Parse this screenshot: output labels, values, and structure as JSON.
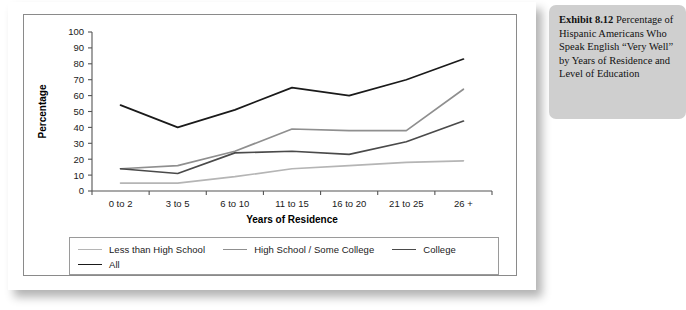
{
  "caption": {
    "lead": "Exhibit 8.12",
    "body": " Percentage of Hispanic Americans Who Speak English “Very Well” by Years of Residence and Level of Education"
  },
  "colors": {
    "series_less_than_high_school": "#b5b5b5",
    "series_high_school_some_college": "#8f8f8f",
    "series_college": "#4a4a4a",
    "series_all": "#1a1a1a",
    "axis": "#555555",
    "frame": "#8a8a8a",
    "caption_bg": "#cfcfcf",
    "card_bg": "#ffffff"
  },
  "chart_data": {
    "type": "line",
    "title": "",
    "xlabel": "Years of Residence",
    "ylabel": "Percentage",
    "categories": [
      "0 to 2",
      "3 to 5",
      "6 to 10",
      "11 to 15",
      "16 to 20",
      "21 to 25",
      "26 +"
    ],
    "ylim": [
      0,
      100
    ],
    "yticks": [
      0,
      10,
      20,
      30,
      40,
      50,
      60,
      70,
      80,
      90,
      100
    ],
    "grid": false,
    "legend_position": "bottom",
    "series": [
      {
        "name": "Less than High School",
        "color": "#b5b5b5",
        "values": [
          5,
          5,
          9,
          14,
          16,
          18,
          19
        ]
      },
      {
        "name": "High School / Some College",
        "color": "#8f8f8f",
        "values": [
          14,
          16,
          25,
          39,
          38,
          38,
          64
        ]
      },
      {
        "name": "College",
        "color": "#4a4a4a",
        "values": [
          14,
          11,
          24,
          25,
          23,
          31,
          44
        ]
      },
      {
        "name": "All",
        "color": "#1a1a1a",
        "values": [
          54,
          40,
          51,
          65,
          60,
          70,
          83
        ]
      }
    ]
  }
}
